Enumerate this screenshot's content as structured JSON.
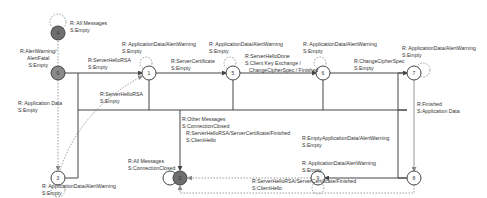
{
  "diagram": {
    "type": "state-machine",
    "colors": {
      "line": "#444444",
      "dotted": "#999999",
      "state_fill_white": "#ffffff",
      "state_fill_grey": "#8a8a8a",
      "state_fill_dark": "#6e6e6e"
    },
    "states": [
      {
        "id": "4",
        "fill": "dark"
      },
      {
        "id": "0",
        "fill": "grey"
      },
      {
        "id": "3",
        "fill": "white"
      },
      {
        "id": "1",
        "fill": "white"
      },
      {
        "id": "5",
        "fill": "white"
      },
      {
        "id": "6",
        "fill": "white"
      },
      {
        "id": "7",
        "fill": "white"
      },
      {
        "id": "8",
        "fill": "white"
      },
      {
        "id": "9",
        "fill": "white"
      },
      {
        "id": "2",
        "fill": "dark"
      }
    ],
    "labels": {
      "s4_loop": [
        "R: All Messages",
        "S:Empty"
      ],
      "s0_alert": [
        "R:AlertWarning/",
        "AlertFatal",
        "S:Empty"
      ],
      "s0_s1": [
        "R:ServerHelloRSA",
        "S:Empty"
      ],
      "s3_to_s0": [
        "R: Application Data",
        "S:Empty"
      ],
      "s3_loop": [
        "R: ApplicationData/AlertWarning",
        "S:Empty"
      ],
      "s3_s1": [
        "R:ServerHelloRSA",
        "S:Empty"
      ],
      "s1_loop": [
        "R: ApplicationData/AlertWarning",
        "S:Empty"
      ],
      "s1_s5": [
        "R:ServerCertificate",
        "S:Empty"
      ],
      "s5_loop": [
        "R: ApplicationData/AlertWarning",
        "S:Empty"
      ],
      "s5_s6": [
        "R:ServerHelloDone",
        "S:Client Key Exchange /",
        "ChangeCipherSpec / Finished"
      ],
      "s6_loop": [
        "R: ApplicationData/AlertWarning",
        "S:Empty"
      ],
      "s6_s7": [
        "R:ChangeCipherSpec",
        "S:Empty"
      ],
      "s7_loop": [
        "R: ApplicationData/AlertWarning",
        "S:Empty"
      ],
      "s7_s8": [
        "R:Finished",
        "S:Application Data"
      ],
      "other_s2": [
        "R:Other Messages",
        "S:ConnectionClosed"
      ],
      "s2_loop": [
        "R:All Messages",
        "S:ConnectionClosed"
      ],
      "s9_s2": [
        "R:ServerHelloRSA/ServerCertificate/Finished",
        "S:ClientHello"
      ],
      "s8_s9": [
        "R:EmptyApplicationData/AlertWarning",
        "S:Empty"
      ],
      "s9_loop": [
        "R: ApplicationData/AlertWarning",
        "S:Empty"
      ],
      "s8_s2": [
        "R:ServerHelloRSA/ServerCertificate/Finished",
        "S:ClientHello"
      ]
    }
  }
}
